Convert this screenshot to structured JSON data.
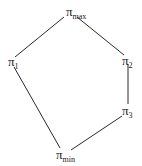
{
  "diagram": {
    "type": "lattice / Hasse diagram",
    "nodes": [
      {
        "id": "max",
        "symbol": "π",
        "subscript": "max"
      },
      {
        "id": "1",
        "symbol": "π",
        "subscript": "1"
      },
      {
        "id": "2",
        "symbol": "π",
        "subscript": "2"
      },
      {
        "id": "3",
        "symbol": "π",
        "subscript": "3"
      },
      {
        "id": "min",
        "symbol": "π",
        "subscript": "min"
      }
    ],
    "edges": [
      [
        "max",
        "1"
      ],
      [
        "max",
        "2"
      ],
      [
        "2",
        "3"
      ],
      [
        "3",
        "min"
      ],
      [
        "1",
        "min"
      ]
    ],
    "line_color": "#2a2a2a"
  }
}
